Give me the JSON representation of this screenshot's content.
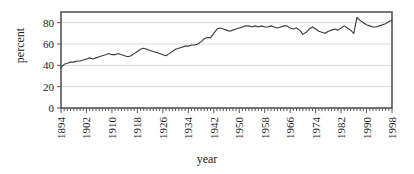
{
  "chart_data": {
    "type": "line",
    "title": "",
    "xlabel": "year",
    "ylabel": "percent",
    "xlim": [
      1894,
      1998
    ],
    "ylim": [
      0,
      90
    ],
    "ytick_values": [
      0,
      20,
      40,
      60,
      80
    ],
    "ytick_labels": [
      "0",
      "20",
      "40",
      "60",
      "80"
    ],
    "xtick_labels": [
      "1894",
      "1902",
      "1910",
      "1918",
      "1926",
      "1934",
      "1942",
      "1950",
      "1958",
      "1966",
      "1974",
      "1982",
      "1990",
      "1998"
    ],
    "xtick_values": [
      1894,
      1902,
      1910,
      1918,
      1926,
      1934,
      1942,
      1950,
      1958,
      1966,
      1974,
      1982,
      1990,
      1998
    ],
    "xtick_interval_minor": 1,
    "grid": "horizontal",
    "legend": "none",
    "line_color": "#3a3a3a",
    "grid_color": "#d9d9d9",
    "frame_color": "#555555",
    "background_color": "#ffffff",
    "x": [
      1894,
      1895,
      1896,
      1897,
      1898,
      1899,
      1900,
      1901,
      1902,
      1903,
      1904,
      1905,
      1906,
      1907,
      1908,
      1909,
      1910,
      1911,
      1912,
      1913,
      1914,
      1915,
      1916,
      1917,
      1918,
      1919,
      1920,
      1921,
      1922,
      1923,
      1924,
      1925,
      1926,
      1927,
      1928,
      1929,
      1930,
      1931,
      1932,
      1933,
      1934,
      1935,
      1936,
      1937,
      1938,
      1939,
      1940,
      1941,
      1942,
      1943,
      1944,
      1945,
      1946,
      1947,
      1948,
      1949,
      1950,
      1951,
      1952,
      1953,
      1954,
      1955,
      1956,
      1957,
      1958,
      1959,
      1960,
      1961,
      1962,
      1963,
      1964,
      1965,
      1966,
      1967,
      1968,
      1969,
      1970,
      1971,
      1972,
      1973,
      1974,
      1975,
      1976,
      1977,
      1978,
      1979,
      1980,
      1981,
      1982,
      1983,
      1984,
      1985,
      1986,
      1987,
      1988,
      1989,
      1990,
      1991,
      1992,
      1993,
      1994,
      1995,
      1996,
      1997,
      1998
    ],
    "values": [
      38,
      41,
      42,
      43,
      43,
      44,
      44,
      45,
      46,
      47,
      46,
      47,
      48,
      49,
      50,
      51,
      50,
      50,
      51,
      50,
      49,
      48,
      49,
      51,
      53,
      55,
      56,
      55,
      54,
      53,
      52,
      51,
      50,
      49,
      51,
      53,
      55,
      56,
      57,
      58,
      58,
      59,
      59,
      60,
      62,
      65,
      66,
      66,
      70,
      74,
      75,
      74,
      73,
      72,
      73,
      74,
      75,
      76,
      77,
      77,
      76,
      77,
      76,
      77,
      76,
      76,
      77,
      76,
      75,
      76,
      77,
      77,
      75,
      74,
      75,
      73,
      69,
      71,
      74,
      76,
      74,
      72,
      71,
      70,
      72,
      73,
      74,
      73,
      75,
      77,
      75,
      73,
      70,
      85,
      82,
      80,
      78,
      77,
      76,
      76,
      77,
      78,
      79,
      81,
      82
    ],
    "series": [
      {
        "name": "percent",
        "values": [
          38,
          41,
          42,
          43,
          43,
          44,
          44,
          45,
          46,
          47,
          46,
          47,
          48,
          49,
          50,
          51,
          50,
          50,
          51,
          50,
          49,
          48,
          49,
          51,
          53,
          55,
          56,
          55,
          54,
          53,
          52,
          51,
          50,
          49,
          51,
          53,
          55,
          56,
          57,
          58,
          58,
          59,
          59,
          60,
          62,
          65,
          66,
          66,
          70,
          74,
          75,
          74,
          73,
          72,
          73,
          74,
          75,
          76,
          77,
          77,
          76,
          77,
          76,
          77,
          76,
          76,
          77,
          76,
          75,
          76,
          77,
          77,
          75,
          74,
          75,
          73,
          69,
          71,
          74,
          76,
          74,
          72,
          71,
          70,
          72,
          73,
          74,
          73,
          75,
          77,
          75,
          73,
          70,
          85,
          82,
          80,
          78,
          77,
          76,
          76,
          77,
          78,
          79,
          81,
          82
        ]
      }
    ]
  },
  "plot_geometry": {
    "left": 61,
    "right": 392,
    "top": 12,
    "bottom": 108
  }
}
